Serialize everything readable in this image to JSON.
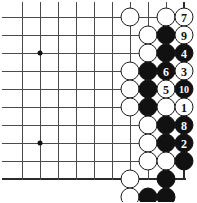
{
  "board": {
    "title": "Go board diagram",
    "size_px": {
      "width": 197,
      "height": 202
    },
    "grid": {
      "origin_x": 22,
      "origin_y": 17,
      "spacing": 18,
      "cols": 10,
      "rows": 10,
      "right_edge_col": 9,
      "bottom_edge_row": 9
    },
    "star_points": [
      {
        "col": 1,
        "row": 2
      },
      {
        "col": 1,
        "row": 7
      }
    ],
    "stones": [
      {
        "col": 6,
        "row": 0,
        "color": "white",
        "label": ""
      },
      {
        "col": 8,
        "row": 0,
        "color": "white",
        "label": ""
      },
      {
        "col": 9,
        "row": 0,
        "color": "white",
        "label": "7"
      },
      {
        "col": 7,
        "row": 1,
        "color": "white",
        "label": ""
      },
      {
        "col": 8,
        "row": 1,
        "color": "black",
        "label": ""
      },
      {
        "col": 9,
        "row": 1,
        "color": "white",
        "label": "9"
      },
      {
        "col": 7,
        "row": 2,
        "color": "white",
        "label": ""
      },
      {
        "col": 8,
        "row": 2,
        "color": "black",
        "label": ""
      },
      {
        "col": 9,
        "row": 2,
        "color": "black",
        "label": "4"
      },
      {
        "col": 6,
        "row": 3,
        "color": "white",
        "label": ""
      },
      {
        "col": 7,
        "row": 3,
        "color": "black",
        "label": ""
      },
      {
        "col": 8,
        "row": 3,
        "color": "black",
        "label": "6"
      },
      {
        "col": 9,
        "row": 3,
        "color": "white",
        "label": "3"
      },
      {
        "col": 6,
        "row": 4,
        "color": "white",
        "label": ""
      },
      {
        "col": 7,
        "row": 4,
        "color": "black",
        "label": ""
      },
      {
        "col": 8,
        "row": 4,
        "color": "white",
        "label": "5"
      },
      {
        "col": 9,
        "row": 4,
        "color": "black",
        "label": "10"
      },
      {
        "col": 6,
        "row": 5,
        "color": "white",
        "label": ""
      },
      {
        "col": 7,
        "row": 5,
        "color": "black",
        "label": ""
      },
      {
        "col": 8,
        "row": 5,
        "color": "white",
        "label": ""
      },
      {
        "col": 9,
        "row": 5,
        "color": "white",
        "label": "1"
      },
      {
        "col": 7,
        "row": 6,
        "color": "white",
        "label": ""
      },
      {
        "col": 8,
        "row": 6,
        "color": "black",
        "label": ""
      },
      {
        "col": 9,
        "row": 6,
        "color": "black",
        "label": "8"
      },
      {
        "col": 7,
        "row": 7,
        "color": "white",
        "label": ""
      },
      {
        "col": 8,
        "row": 7,
        "color": "black",
        "label": ""
      },
      {
        "col": 9,
        "row": 7,
        "color": "black",
        "label": "2"
      },
      {
        "col": 7,
        "row": 8,
        "color": "white",
        "label": ""
      },
      {
        "col": 8,
        "row": 8,
        "color": "white",
        "label": ""
      },
      {
        "col": 9,
        "row": 8,
        "color": "black",
        "label": ""
      },
      {
        "col": 6,
        "row": 9,
        "color": "white",
        "label": ""
      },
      {
        "col": 8,
        "row": 9,
        "color": "black",
        "label": ""
      },
      {
        "col": 6,
        "row": 10,
        "color": "white",
        "label": ""
      },
      {
        "col": 7,
        "row": 10,
        "color": "black",
        "label": ""
      },
      {
        "col": 8,
        "row": 10,
        "color": "black",
        "label": ""
      }
    ]
  }
}
